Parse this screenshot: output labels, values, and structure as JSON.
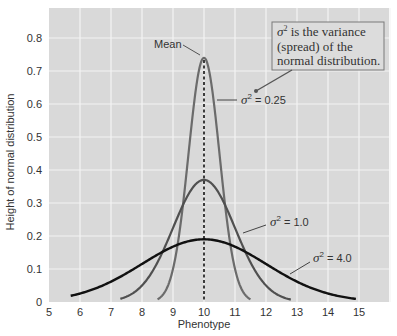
{
  "chart_data": {
    "type": "line",
    "title": "",
    "xlabel": "Phenotype",
    "ylabel": "Height of normal distribution",
    "xlim": [
      5,
      16.2
    ],
    "ylim": [
      0,
      0.89
    ],
    "xticks": [
      5,
      6,
      7,
      8,
      9,
      10,
      11,
      12,
      13,
      14,
      15
    ],
    "yticks": [
      0,
      0.1,
      0.2,
      0.3,
      0.4,
      0.5,
      0.6,
      0.7,
      0.8
    ],
    "grid": true,
    "legend": "none (inline annotations)",
    "mean": 10,
    "series": [
      {
        "name": "σ² = 0.25",
        "mean": 10,
        "variance": 0.25,
        "peak": 0.74,
        "color": "#6b6b6b",
        "x": [
          8.5,
          9.0,
          9.25,
          9.5,
          9.75,
          10.0,
          10.25,
          10.5,
          10.75,
          11.0,
          11.5
        ],
        "y": [
          0.0,
          0.11,
          0.24,
          0.48,
          0.7,
          0.74,
          0.7,
          0.48,
          0.24,
          0.11,
          0.0
        ]
      },
      {
        "name": "σ² = 1.0",
        "mean": 10,
        "variance": 1.0,
        "peak": 0.37,
        "color": "#505050",
        "x": [
          7.3,
          8,
          8.5,
          9,
          9.5,
          10,
          10.5,
          11,
          11.5,
          12,
          12.8
        ],
        "y": [
          0.0,
          0.05,
          0.13,
          0.24,
          0.35,
          0.37,
          0.35,
          0.24,
          0.13,
          0.05,
          0.0
        ]
      },
      {
        "name": "σ² = 4.0",
        "mean": 10,
        "variance": 4.0,
        "peak": 0.19,
        "color": "#111111",
        "x": [
          5.7,
          6,
          7,
          8,
          9,
          10,
          11,
          12,
          13,
          14,
          14.9
        ],
        "y": [
          0.0,
          0.03,
          0.06,
          0.11,
          0.17,
          0.19,
          0.17,
          0.11,
          0.06,
          0.03,
          0.01
        ]
      }
    ],
    "annotations": [
      {
        "text": "Mean",
        "target": "x = 10 dashed line"
      },
      {
        "text": "σ² = 0.25"
      },
      {
        "text": "σ² = 1.0"
      },
      {
        "text": "σ² = 4.0"
      },
      {
        "text": "σ² is the variance (spread) of the normal distribution."
      }
    ]
  },
  "labels": {
    "xlabel": "Phenotype",
    "ylabel": "Height of normal distribution",
    "mean": "Mean",
    "sigma": "σ",
    "sup": "2",
    "var025": " = 0.25",
    "var1": " = 1.0",
    "var4": " = 4.0",
    "callout_line1_rest": " is the variance",
    "callout_line2": "(spread) of the",
    "callout_line3": "normal distribution."
  },
  "xtick_labels": [
    "5",
    "6",
    "7",
    "8",
    "9",
    "10",
    "11",
    "12",
    "13",
    "14",
    "15"
  ],
  "ytick_labels": [
    "0",
    "0.1",
    "0.2",
    "0.3",
    "0.4",
    "0.5",
    "0.6",
    "0.7",
    "0.8"
  ],
  "colors": {
    "plot_bg": "#d9d9d9",
    "grid": "#f4f4f4",
    "curve_025": "#6b6b6b",
    "curve_1": "#505050",
    "curve_4": "#111111",
    "callout_bg": "#dcdcdc",
    "callout_border": "#7a7a7a"
  }
}
